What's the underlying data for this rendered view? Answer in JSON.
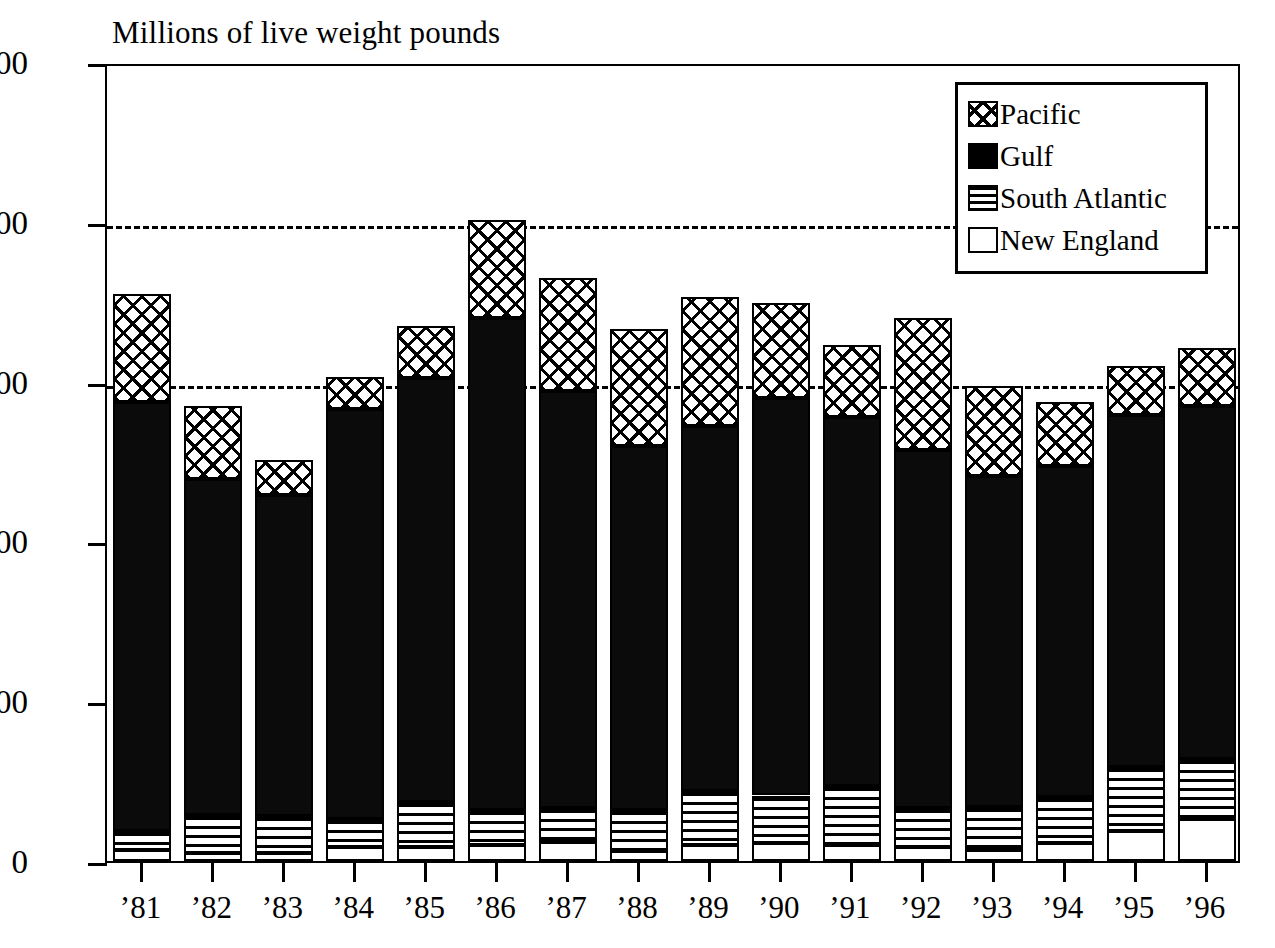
{
  "chart_data": {
    "type": "bar",
    "subtype": "stacked-bar",
    "title": "Millions of live weight pounds",
    "xlabel": "",
    "ylabel": "",
    "ylim": [
      0,
      500
    ],
    "ytick_values": [
      0,
      100,
      200,
      300,
      400,
      500
    ],
    "ytick_labels": [
      "0",
      "100",
      "200",
      "300",
      "400",
      "500"
    ],
    "grid": "horizontal dashed at 300 and 400",
    "gridline_values": [
      300,
      400
    ],
    "legend_position": "top-right",
    "categories": [
      "’81",
      "’82",
      "’83",
      "’84",
      "’85",
      "’86",
      "’87",
      "’88",
      "’89",
      "’90",
      "’91",
      "’92",
      "’93",
      "’94",
      "’95",
      "’96"
    ],
    "stack_order_bottom_to_top": [
      "New England",
      "South Atlantic",
      "Gulf",
      "Pacific"
    ],
    "series": [
      {
        "name": "New England",
        "pattern": "white",
        "values": [
          7,
          5,
          5,
          9,
          9,
          10,
          12,
          6,
          10,
          11,
          10,
          9,
          7,
          11,
          19,
          26
        ]
      },
      {
        "name": "South Atlantic",
        "pattern": "horizontal-lines",
        "values": [
          12,
          24,
          23,
          17,
          28,
          22,
          21,
          26,
          34,
          30,
          37,
          24,
          27,
          29,
          40,
          38
        ]
      },
      {
        "name": "Gulf",
        "pattern": "solid-black",
        "values": [
          268,
          210,
          201,
          257,
          265,
          308,
          261,
          228,
          228,
          249,
          231,
          224,
          207,
          207,
          220,
          221
        ]
      },
      {
        "name": "Pacific",
        "pattern": "cross-hatch",
        "values": [
          68,
          46,
          22,
          20,
          33,
          61,
          71,
          73,
          81,
          59,
          45,
          83,
          56,
          40,
          31,
          36
        ]
      }
    ],
    "totals": [
      355,
      285,
      251,
      303,
      335,
      401,
      365,
      333,
      353,
      349,
      323,
      340,
      297,
      287,
      310,
      321
    ]
  },
  "legend": {
    "items": [
      {
        "label": "Pacific",
        "swatch": "cross-hatch-swatch"
      },
      {
        "label": "Gulf",
        "swatch": "solid-black-swatch"
      },
      {
        "label": "South Atlantic",
        "swatch": "horizontal-lines-swatch"
      },
      {
        "label": "New England",
        "swatch": "white-swatch"
      }
    ]
  },
  "colors": {
    "ink": "#000000",
    "paper": "#ffffff"
  }
}
